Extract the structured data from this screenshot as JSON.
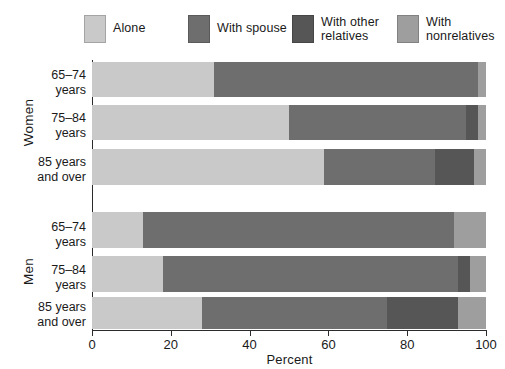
{
  "chart_data": {
    "type": "bar",
    "orientation": "horizontal",
    "stacked": true,
    "title": "",
    "subtitle": "",
    "xlabel": "Percent",
    "ylabel": "",
    "xlim": [
      0,
      100
    ],
    "xticks": [
      0,
      20,
      40,
      60,
      80,
      100
    ],
    "xtick_labels": [
      "0",
      "20",
      "40",
      "60",
      "80",
      "100"
    ],
    "grid": false,
    "legend_position": "top",
    "legend": [
      "Alone",
      "With spouse",
      "With other\nrelatives",
      "With\nnonrelatives"
    ],
    "series": [
      {
        "name": "Alone",
        "color": "#c9c9c9",
        "values": [
          31,
          50,
          59,
          13,
          18,
          28
        ]
      },
      {
        "name": "With spouse",
        "color": "#6e6e6e",
        "values": [
          67,
          45,
          28,
          79,
          75,
          47
        ]
      },
      {
        "name": "With other relatives",
        "color": "#565656",
        "values": [
          0,
          3,
          10,
          0,
          3,
          18
        ]
      },
      {
        "name": "With nonrelatives",
        "color": "#9e9e9e",
        "values": [
          2,
          2,
          3,
          8,
          4,
          7
        ]
      }
    ],
    "groups": [
      {
        "name": "Women",
        "categories": [
          "65–74\nyears",
          "75–84\nyears",
          "85 years\nand over"
        ]
      },
      {
        "name": "Men",
        "categories": [
          "65–74\nyears",
          "75–84\nyears",
          "85 years\nand over"
        ]
      }
    ],
    "category_labels": [
      "65–74\nyears",
      "75–84\nyears",
      "85 years\nand over",
      "65–74\nyears",
      "75–84\nyears",
      "85 years\nand over"
    ],
    "bars": [
      {
        "group": "Women",
        "category": "65–74 years",
        "segments": [
          31,
          67,
          0,
          2
        ]
      },
      {
        "group": "Women",
        "category": "75–84 years",
        "segments": [
          50,
          45,
          3,
          2
        ]
      },
      {
        "group": "Women",
        "category": "85 years and over",
        "segments": [
          59,
          28,
          10,
          3
        ]
      },
      {
        "group": "Men",
        "category": "65–74 years",
        "segments": [
          13,
          79,
          0,
          8
        ]
      },
      {
        "group": "Men",
        "category": "75–84 years",
        "segments": [
          18,
          75,
          3,
          4
        ]
      },
      {
        "group": "Men",
        "category": "85 years and over",
        "segments": [
          28,
          47,
          18,
          7
        ]
      }
    ],
    "colors": {
      "alone": "#c9c9c9",
      "with_spouse": "#6e6e6e",
      "with_other_relatives": "#565656",
      "with_nonrelatives": "#9e9e9e",
      "axis": "#2b2b2b",
      "text": "#1a1a1a",
      "background": "#ffffff"
    }
  }
}
